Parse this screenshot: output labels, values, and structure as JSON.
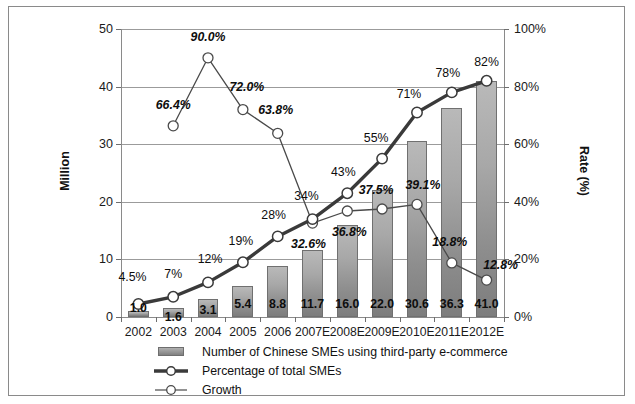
{
  "chart_data": {
    "type": "bar",
    "title": "",
    "subtitle": "",
    "categories": [
      "2002",
      "2003",
      "2004",
      "2005",
      "2006",
      "2007E",
      "2008E",
      "2009E",
      "2010E",
      "2011E",
      "2012E"
    ],
    "xlabel": "",
    "ylabel": "Million",
    "y2label": "Rate (%)",
    "ylim": [
      0,
      50
    ],
    "y2lim": [
      0,
      100
    ],
    "y_ticks": [
      "0",
      "10",
      "20",
      "30",
      "40",
      "50"
    ],
    "y2_ticks": [
      "0%",
      "20%",
      "40%",
      "60%",
      "80%",
      "100%"
    ],
    "grid": true,
    "legend_position": "bottom-left",
    "series": [
      {
        "name": "Number of Chinese SMEs using third-party e-commerce",
        "type": "bar",
        "axis": "left",
        "unit": "Million",
        "values": [
          1.0,
          1.6,
          3.1,
          5.4,
          8.8,
          11.7,
          16.0,
          22.0,
          30.6,
          36.3,
          41.0
        ],
        "labels": [
          "1.0",
          "1.6",
          "3.1",
          "5.4",
          "8.8",
          "11.7",
          "16.0",
          "22.0",
          "30.6",
          "36.3",
          "41.0"
        ]
      },
      {
        "name": "Percentage of total SMEs",
        "type": "line",
        "axis": "right",
        "unit": "%",
        "values": [
          4.5,
          7,
          12,
          19,
          28,
          34,
          43,
          55,
          71,
          78,
          82
        ],
        "labels": [
          "4.5%",
          "7%",
          "12%",
          "19%",
          "28%",
          "34%",
          "43%",
          "55%",
          "71%",
          "78%",
          "82%"
        ]
      },
      {
        "name": "Growth",
        "type": "line",
        "axis": "right",
        "unit": "%",
        "values": [
          null,
          66.4,
          90.0,
          72.0,
          63.8,
          32.6,
          36.8,
          37.5,
          39.1,
          18.8,
          12.8
        ],
        "labels": [
          "",
          "66.4%",
          "90.0%",
          "72.0%",
          "63.8%",
          "32.6%",
          "36.8%",
          "37.5%",
          "39.1%",
          "18.8%",
          "12.8%"
        ]
      }
    ],
    "colors": {
      "bar_top": "#b9b9b9",
      "bar_bottom": "#7d7d7d",
      "line_percentage": "#3a3a3a",
      "line_growth": "#4a4a4a",
      "marker_fill": "#ffffff",
      "grid": "#9b9b9b",
      "axis": "#8a8a8a",
      "text": "#111111",
      "background": "#ffffff"
    }
  },
  "legend": {
    "items": [
      {
        "label": "Number of Chinese SMEs using third-party e-commerce",
        "key": "bar-swatch"
      },
      {
        "label": "Percentage of total SMEs",
        "key": "thick-line-marker"
      },
      {
        "label": "Growth",
        "key": "thin-line-marker"
      }
    ]
  }
}
